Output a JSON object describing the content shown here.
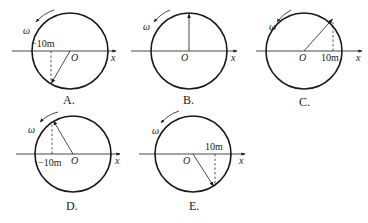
{
  "panels": [
    {
      "id": "A",
      "label": "A.",
      "center": [
        70,
        51
      ],
      "radius": 38,
      "radius_angle_deg": 240,
      "projection_label": "−10m",
      "projection_side": "left",
      "origin_label": "O",
      "axis_label": "x",
      "omega_label": "ω"
    },
    {
      "id": "B",
      "label": "B.",
      "center": [
        189,
        51
      ],
      "radius": 38,
      "radius_angle_deg": 90,
      "projection_label": "",
      "origin_label": "O",
      "axis_label": "x",
      "omega_label": "ω"
    },
    {
      "id": "C",
      "label": "C.",
      "center": [
        304,
        51
      ],
      "radius": 38,
      "radius_angle_deg": 60,
      "projection_label": "10m",
      "projection_side": "right",
      "origin_label": "O",
      "axis_label": "x",
      "omega_label": "ω"
    },
    {
      "id": "D",
      "label": "D.",
      "center": [
        73,
        154
      ],
      "radius": 38,
      "radius_angle_deg": 120,
      "projection_label": "−10m",
      "projection_side": "left",
      "origin_label": "O",
      "axis_label": "x",
      "omega_label": "ω"
    },
    {
      "id": "E",
      "label": "E.",
      "center": [
        193,
        154
      ],
      "radius": 38,
      "radius_angle_deg": 300,
      "projection_label": "10m",
      "projection_side": "right",
      "origin_label": "O",
      "axis_label": "x",
      "omega_label": "ω"
    }
  ],
  "colors": {
    "stroke": "#1a1a1a",
    "background": "#ffffff"
  }
}
